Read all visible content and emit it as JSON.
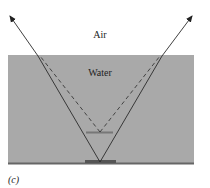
{
  "labels": {
    "air": "Air",
    "water": "Water",
    "caption": "(c)"
  },
  "colors": {
    "water_fill": "#a9a9a9",
    "line": "#2a2a2a",
    "object": "#555555",
    "bottom": "#666666"
  },
  "geometry": {
    "water_rect": {
      "x": 8,
      "y": 55,
      "w": 186,
      "h": 109
    },
    "object_point": [
      100,
      162
    ],
    "virtual_image_point": [
      100,
      132
    ],
    "surface_y": 55,
    "solid_rays": [
      {
        "from": [
          100,
          162
        ],
        "via": [
          38,
          55
        ],
        "to": [
          9,
          15
        ]
      },
      {
        "from": [
          100,
          162
        ],
        "via": [
          162,
          55
        ],
        "to": [
          193,
          15
        ]
      }
    ],
    "dashed_rays": [
      {
        "from": [
          100,
          132
        ],
        "to": [
          42,
          55
        ]
      },
      {
        "from": [
          100,
          132
        ],
        "to": [
          158,
          55
        ]
      }
    ]
  }
}
